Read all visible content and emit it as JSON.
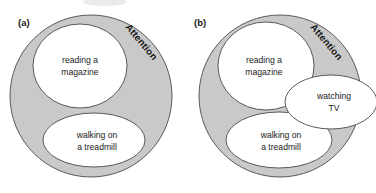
{
  "figure": {
    "type": "venn-style-concept-diagram",
    "background_color": "#ffffff",
    "fill_gray": "#c9c9c9",
    "fill_white": "#ffffff",
    "stroke_color": "#4a4a4a"
  },
  "panels": [
    {
      "id": "a",
      "label": "(a)",
      "outer": {
        "name": "attention-circle",
        "label": "Attention",
        "label_rotation_deg": 50,
        "fill": "#c9c9c9",
        "cx": 91,
        "cy": 96,
        "r": 81
      },
      "inner": [
        {
          "name": "reading-a-magazine-circle",
          "line1": "reading a",
          "line2": "magazine",
          "fill": "#ffffff",
          "cx": 80,
          "cy": 66,
          "rx": 47,
          "ry": 42
        },
        {
          "name": "walking-on-a-treadmill-ellipse",
          "line1": "walking on",
          "line2": "a treadmill",
          "fill": "#ffffff",
          "cx": 94,
          "cy": 140,
          "rx": 51,
          "ry": 27
        }
      ]
    },
    {
      "id": "b",
      "label": "(b)",
      "outer": {
        "name": "attention-circle",
        "label": "Attention",
        "label_rotation_deg": 50,
        "fill": "#c9c9c9",
        "cx": 92,
        "cy": 96,
        "r": 81
      },
      "inner": [
        {
          "name": "reading-a-magazine-circle",
          "line1": "reading a",
          "line2": "magazine",
          "fill": "#ffffff",
          "cx": 78,
          "cy": 66,
          "rx": 48,
          "ry": 44
        },
        {
          "name": "walking-on-a-treadmill-ellipse",
          "line1": "walking on",
          "line2": "a treadmill",
          "fill": "#ffffff",
          "cx": 91,
          "cy": 140,
          "rx": 53,
          "ry": 28
        },
        {
          "name": "watching-tv-ellipse",
          "line1": "watching",
          "line2": "TV",
          "fill": "#ffffff",
          "cx": 143,
          "cy": 102,
          "rx": 46,
          "ry": 27
        }
      ]
    }
  ]
}
